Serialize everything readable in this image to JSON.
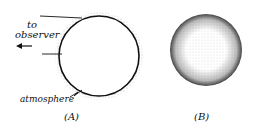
{
  "figure": {
    "panel_a": {
      "label": "(A)",
      "annotation_observer": [
        "to",
        "observer"
      ],
      "annotation_atmosphere": "atmosphere"
    },
    "panel_b": {
      "label": "(B)"
    }
  }
}
